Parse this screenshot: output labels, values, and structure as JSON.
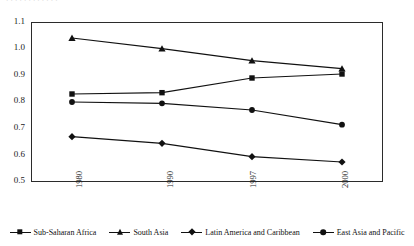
{
  "figure": {
    "top_cutoff_text": "· · · · · · · · · · · ·",
    "background_color": "#ffffff",
    "line_color": "#111111"
  },
  "chart_data": {
    "type": "line",
    "title": "",
    "subtitle": "",
    "xlabel": "",
    "ylabel": "",
    "categories": [
      "1980",
      "1990",
      "1997",
      "2000"
    ],
    "x_tick_rotation": -90,
    "ylim": [
      0.5,
      1.1
    ],
    "yticks": [
      "1.1",
      "1.0",
      "0.9",
      "0.8",
      "0.7",
      "0.6",
      "0.5"
    ],
    "ytick_values": [
      1.1,
      1.0,
      0.9,
      0.8,
      0.7,
      0.6,
      0.5
    ],
    "grid": false,
    "legend_position": "bottom",
    "series": [
      {
        "name": "Sub-Saharan Africa",
        "marker": "square",
        "values": [
          0.83,
          0.835,
          0.89,
          0.905
        ]
      },
      {
        "name": "South Asia",
        "marker": "triangle",
        "values": [
          1.04,
          1.0,
          0.955,
          0.925
        ]
      },
      {
        "name": "Latin America and Caribbean",
        "marker": "diamond",
        "values": [
          0.67,
          0.645,
          0.595,
          0.575
        ]
      },
      {
        "name": "East Asia and Pacific",
        "marker": "circle",
        "values": [
          0.8,
          0.795,
          0.77,
          0.715
        ]
      }
    ]
  }
}
